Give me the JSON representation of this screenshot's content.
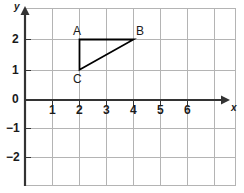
{
  "chart_data": {
    "type": "scatter",
    "title": "",
    "xlabel": "x",
    "ylabel": "y",
    "xlim": [
      -0.2,
      7.0
    ],
    "ylim": [
      -3.1,
      2.9
    ],
    "grid": true,
    "legend": null,
    "x_ticks": [
      {
        "value": 1,
        "label": "1"
      },
      {
        "value": 2,
        "label": "2"
      },
      {
        "value": 3,
        "label": "3"
      },
      {
        "value": 4,
        "label": "4"
      },
      {
        "value": 5,
        "label": "5"
      },
      {
        "value": 6,
        "label": "6"
      }
    ],
    "y_ticks": [
      {
        "value": 2,
        "label": "2"
      },
      {
        "value": 1,
        "label": "1"
      },
      {
        "value": -1,
        "label": "−1"
      },
      {
        "value": -2,
        "label": "−2"
      }
    ],
    "origin_label": "0",
    "shapes": [
      {
        "name": "triangle-abc",
        "type": "polygon",
        "closed": true,
        "stroke": "#000000",
        "fill": "none",
        "points": [
          {
            "label": "A",
            "x": 2,
            "y": 2
          },
          {
            "label": "B",
            "x": 4,
            "y": 2
          },
          {
            "label": "C",
            "x": 2,
            "y": 1
          }
        ]
      }
    ],
    "vertex_labels": [
      {
        "label": "A",
        "x": 2,
        "y": 2
      },
      {
        "label": "B",
        "x": 4,
        "y": 2
      },
      {
        "label": "C",
        "x": 2,
        "y": 1
      }
    ],
    "colors": {
      "grid": "#b4b4b4",
      "axis": "#333333",
      "shape_stroke": "#000000",
      "text": "#1a1a1a",
      "background": "#ffffff"
    }
  }
}
